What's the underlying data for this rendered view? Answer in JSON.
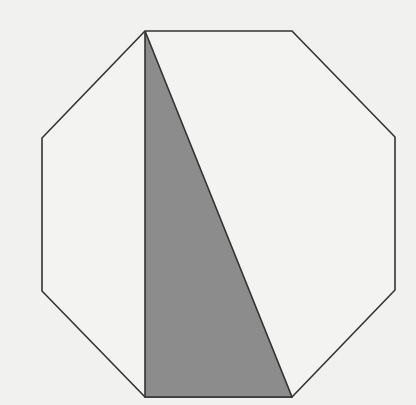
{
  "diagram": {
    "type": "geometry",
    "colors": {
      "background": "#f1f1f0",
      "stroke": "#333333",
      "shaded_fill": "#8c8c8c",
      "octagon_fill": "#f3f3f2"
    },
    "octagon": {
      "vertices": [
        [
          145,
          31
        ],
        [
          292,
          31
        ],
        [
          395,
          137
        ],
        [
          395,
          290
        ],
        [
          292,
          397
        ],
        [
          145,
          397
        ],
        [
          42,
          291
        ],
        [
          42,
          138
        ]
      ]
    },
    "shaded_triangle": {
      "vertices": [
        [
          145,
          31
        ],
        [
          145,
          397
        ],
        [
          292,
          397
        ]
      ]
    }
  }
}
